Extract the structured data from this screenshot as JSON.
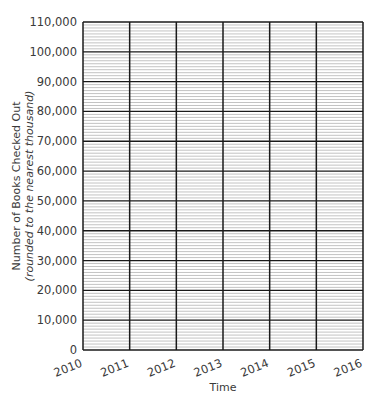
{
  "chart_data": {
    "type": "line",
    "title": "",
    "xlabel": "Time",
    "ylabel": "Number of Books Checked Out",
    "ylabel_sub": "(rounded to the nearest thousand)",
    "x_ticks": [
      "2010",
      "2011",
      "2012",
      "2013",
      "2014",
      "2015",
      "2016"
    ],
    "y_ticks": [
      "0",
      "10,000",
      "20,000",
      "30,000",
      "40,000",
      "50,000",
      "60,000",
      "70,000",
      "80,000",
      "90,000",
      "100,000",
      "110,000"
    ],
    "xlim": [
      2010,
      2016
    ],
    "ylim": [
      0,
      110000
    ],
    "y_major_step": 10000,
    "y_minor_step": 1000,
    "grid": true,
    "series": [],
    "note": "Blank grid — no data plotted"
  },
  "colors": {
    "major_grid": "#1a1a1a",
    "minor_grid": "#9a9a9a",
    "text": "#3a3a3a"
  }
}
